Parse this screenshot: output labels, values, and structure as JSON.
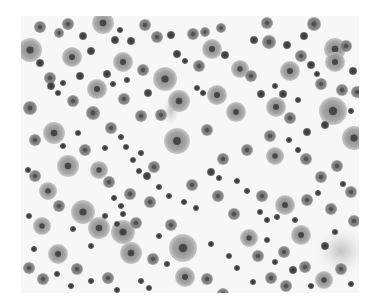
{
  "image": {
    "description": "Grayscale micrograph of many scattered round cells of varying size; large pale cells with dark central nuclei and numerous small dark cells on a light background",
    "width": 338,
    "height": 277,
    "background": "#f7f7f7",
    "colors": {
      "large_cell": "#9a9a9a",
      "large_cell_edge": "#b5b5b5",
      "nucleus": "#3a3a3a",
      "medium_cell": "#707070",
      "small_cell": "#4a4a4a",
      "smear": "#c8c8c8"
    },
    "smears": [
      {
        "cx": 320,
        "cy": 235,
        "rx": 30,
        "ry": 28
      },
      {
        "cx": 150,
        "cy": 95,
        "rx": 10,
        "ry": 18
      },
      {
        "cx": 330,
        "cy": 120,
        "rx": 12,
        "ry": 8
      }
    ],
    "large_cells": [
      {
        "cx": 9,
        "cy": 34,
        "r": 12
      },
      {
        "cx": 51,
        "cy": 41,
        "r": 10
      },
      {
        "cx": 82,
        "cy": 7,
        "r": 11
      },
      {
        "cx": 33,
        "cy": 117,
        "r": 11
      },
      {
        "cx": 47,
        "cy": 150,
        "r": 11
      },
      {
        "cx": 76,
        "cy": 73,
        "r": 10
      },
      {
        "cx": 102,
        "cy": 46,
        "r": 10
      },
      {
        "cx": 144,
        "cy": 63,
        "r": 12
      },
      {
        "cx": 156,
        "cy": 125,
        "r": 13
      },
      {
        "cx": 158,
        "cy": 85,
        "r": 11
      },
      {
        "cx": 191,
        "cy": 33,
        "r": 10
      },
      {
        "cx": 196,
        "cy": 79,
        "r": 10
      },
      {
        "cx": 215,
        "cy": 96,
        "r": 10
      },
      {
        "cx": 219,
        "cy": 53,
        "r": 9
      },
      {
        "cx": 255,
        "cy": 91,
        "r": 10
      },
      {
        "cx": 269,
        "cy": 55,
        "r": 10
      },
      {
        "cx": 312,
        "cy": 95,
        "r": 14
      },
      {
        "cx": 333,
        "cy": 122,
        "r": 12
      },
      {
        "cx": 314,
        "cy": 33,
        "r": 11
      },
      {
        "cx": 314,
        "cy": 46,
        "r": 10
      },
      {
        "cx": 303,
        "cy": 264,
        "r": 9
      },
      {
        "cx": 62,
        "cy": 196,
        "r": 12
      },
      {
        "cx": 78,
        "cy": 212,
        "r": 11
      },
      {
        "cx": 102,
        "cy": 216,
        "r": 12
      },
      {
        "cx": 110,
        "cy": 237,
        "r": 11
      },
      {
        "cx": 162,
        "cy": 232,
        "r": 14
      },
      {
        "cx": 164,
        "cy": 261,
        "r": 10
      },
      {
        "cx": 21,
        "cy": 210,
        "r": 9
      },
      {
        "cx": 37,
        "cy": 238,
        "r": 10
      },
      {
        "cx": 78,
        "cy": 154,
        "r": 9
      },
      {
        "cx": 264,
        "cy": 189,
        "r": 10
      },
      {
        "cx": 280,
        "cy": 219,
        "r": 10
      },
      {
        "cx": 254,
        "cy": 140,
        "r": 9
      },
      {
        "cx": 27,
        "cy": 175,
        "r": 9
      },
      {
        "cx": 228,
        "cy": 222,
        "r": 9
      }
    ],
    "medium_cells": [
      {
        "cx": 19,
        "cy": 11,
        "r": 6
      },
      {
        "cx": 47,
        "cy": 8,
        "r": 6
      },
      {
        "cx": 124,
        "cy": 9,
        "r": 6
      },
      {
        "cx": 172,
        "cy": 18,
        "r": 6
      },
      {
        "cx": 200,
        "cy": 12,
        "r": 5
      },
      {
        "cx": 248,
        "cy": 26,
        "r": 7
      },
      {
        "cx": 246,
        "cy": 7,
        "r": 6
      },
      {
        "cx": 293,
        "cy": 8,
        "r": 7
      },
      {
        "cx": 325,
        "cy": 30,
        "r": 6
      },
      {
        "cx": 29,
        "cy": 62,
        "r": 6
      },
      {
        "cx": 38,
        "cy": 17,
        "r": 5
      },
      {
        "cx": 72,
        "cy": 97,
        "r": 7
      },
      {
        "cx": 52,
        "cy": 85,
        "r": 6
      },
      {
        "cx": 103,
        "cy": 83,
        "r": 6
      },
      {
        "cx": 122,
        "cy": 54,
        "r": 6
      },
      {
        "cx": 136,
        "cy": 21,
        "r": 6
      },
      {
        "cx": 178,
        "cy": 50,
        "r": 6
      },
      {
        "cx": 184,
        "cy": 16,
        "r": 5
      },
      {
        "cx": 230,
        "cy": 60,
        "r": 6
      },
      {
        "cx": 280,
        "cy": 40,
        "r": 6
      },
      {
        "cx": 300,
        "cy": 68,
        "r": 6
      },
      {
        "cx": 321,
        "cy": 74,
        "r": 6
      },
      {
        "cx": 336,
        "cy": 76,
        "r": 6
      },
      {
        "cx": 9,
        "cy": 92,
        "r": 7
      },
      {
        "cx": 14,
        "cy": 124,
        "r": 6
      },
      {
        "cx": 64,
        "cy": 134,
        "r": 6
      },
      {
        "cx": 90,
        "cy": 112,
        "r": 6
      },
      {
        "cx": 120,
        "cy": 100,
        "r": 6
      },
      {
        "cx": 140,
        "cy": 99,
        "r": 6
      },
      {
        "cx": 186,
        "cy": 114,
        "r": 6
      },
      {
        "cx": 202,
        "cy": 143,
        "r": 6
      },
      {
        "cx": 226,
        "cy": 134,
        "r": 6
      },
      {
        "cx": 249,
        "cy": 120,
        "r": 6
      },
      {
        "cx": 269,
        "cy": 102,
        "r": 6
      },
      {
        "cx": 285,
        "cy": 143,
        "r": 6
      },
      {
        "cx": 300,
        "cy": 161,
        "r": 6
      },
      {
        "cx": 316,
        "cy": 150,
        "r": 6
      },
      {
        "cx": 330,
        "cy": 176,
        "r": 6
      },
      {
        "cx": 14,
        "cy": 160,
        "r": 6
      },
      {
        "cx": 38,
        "cy": 190,
        "r": 6
      },
      {
        "cx": 88,
        "cy": 166,
        "r": 6
      },
      {
        "cx": 109,
        "cy": 178,
        "r": 6
      },
      {
        "cx": 133,
        "cy": 151,
        "r": 6
      },
      {
        "cx": 171,
        "cy": 169,
        "r": 6
      },
      {
        "cx": 197,
        "cy": 180,
        "r": 6
      },
      {
        "cx": 213,
        "cy": 198,
        "r": 6
      },
      {
        "cx": 241,
        "cy": 180,
        "r": 6
      },
      {
        "cx": 286,
        "cy": 184,
        "r": 6
      },
      {
        "cx": 310,
        "cy": 193,
        "r": 6
      },
      {
        "cx": 8,
        "cy": 252,
        "r": 6
      },
      {
        "cx": 22,
        "cy": 263,
        "r": 6
      },
      {
        "cx": 56,
        "cy": 253,
        "r": 6
      },
      {
        "cx": 87,
        "cy": 262,
        "r": 6
      },
      {
        "cx": 132,
        "cy": 243,
        "r": 6
      },
      {
        "cx": 186,
        "cy": 263,
        "r": 6
      },
      {
        "cx": 202,
        "cy": 278,
        "r": 6
      },
      {
        "cx": 237,
        "cy": 240,
        "r": 6
      },
      {
        "cx": 263,
        "cy": 236,
        "r": 6
      },
      {
        "cx": 284,
        "cy": 251,
        "r": 6
      },
      {
        "cx": 250,
        "cy": 262,
        "r": 6
      },
      {
        "cx": 265,
        "cy": 270,
        "r": 6
      },
      {
        "cx": 320,
        "cy": 253,
        "r": 6
      },
      {
        "cx": 333,
        "cy": 205,
        "r": 6
      },
      {
        "cx": 150,
        "cy": 209,
        "r": 6
      },
      {
        "cx": 129,
        "cy": 186,
        "r": 6
      },
      {
        "cx": 115,
        "cy": 207,
        "r": 6
      }
    ],
    "small_cells": [
      {
        "cx": 62,
        "cy": 20,
        "r": 4
      },
      {
        "cx": 70,
        "cy": 35,
        "r": 4
      },
      {
        "cx": 94,
        "cy": 24,
        "r": 4
      },
      {
        "cx": 99,
        "cy": 14,
        "r": 3
      },
      {
        "cx": 110,
        "cy": 25,
        "r": 4
      },
      {
        "cx": 150,
        "cy": 19,
        "r": 4
      },
      {
        "cx": 156,
        "cy": 38,
        "r": 4
      },
      {
        "cx": 164,
        "cy": 45,
        "r": 3
      },
      {
        "cx": 204,
        "cy": 39,
        "r": 4
      },
      {
        "cx": 233,
        "cy": 24,
        "r": 4
      },
      {
        "cx": 266,
        "cy": 29,
        "r": 4
      },
      {
        "cx": 283,
        "cy": 20,
        "r": 4
      },
      {
        "cx": 290,
        "cy": 49,
        "r": 4
      },
      {
        "cx": 296,
        "cy": 58,
        "r": 3
      },
      {
        "cx": 332,
        "cy": 55,
        "r": 4
      },
      {
        "cx": 19,
        "cy": 47,
        "r": 4
      },
      {
        "cx": 30,
        "cy": 70,
        "r": 4
      },
      {
        "cx": 37,
        "cy": 77,
        "r": 3
      },
      {
        "cx": 42,
        "cy": 67,
        "r": 3
      },
      {
        "cx": 59,
        "cy": 60,
        "r": 4
      },
      {
        "cx": 86,
        "cy": 58,
        "r": 4
      },
      {
        "cx": 92,
        "cy": 68,
        "r": 3
      },
      {
        "cx": 106,
        "cy": 64,
        "r": 3
      },
      {
        "cx": 127,
        "cy": 77,
        "r": 4
      },
      {
        "cx": 176,
        "cy": 72,
        "r": 3
      },
      {
        "cx": 182,
        "cy": 77,
        "r": 3
      },
      {
        "cx": 240,
        "cy": 78,
        "r": 4
      },
      {
        "cx": 254,
        "cy": 70,
        "r": 3
      },
      {
        "cx": 262,
        "cy": 78,
        "r": 4
      },
      {
        "cx": 277,
        "cy": 84,
        "r": 3
      },
      {
        "cx": 330,
        "cy": 95,
        "r": 3
      },
      {
        "cx": 304,
        "cy": 109,
        "r": 4
      },
      {
        "cx": 286,
        "cy": 116,
        "r": 4
      },
      {
        "cx": 268,
        "cy": 124,
        "r": 3
      },
      {
        "cx": 277,
        "cy": 134,
        "r": 3
      },
      {
        "cx": 7,
        "cy": 154,
        "r": 3
      },
      {
        "cx": 42,
        "cy": 130,
        "r": 3
      },
      {
        "cx": 57,
        "cy": 117,
        "r": 3
      },
      {
        "cx": 84,
        "cy": 132,
        "r": 3
      },
      {
        "cx": 100,
        "cy": 121,
        "r": 3
      },
      {
        "cx": 105,
        "cy": 131,
        "r": 3
      },
      {
        "cx": 112,
        "cy": 144,
        "r": 3
      },
      {
        "cx": 120,
        "cy": 137,
        "r": 3
      },
      {
        "cx": 118,
        "cy": 155,
        "r": 3
      },
      {
        "cx": 126,
        "cy": 160,
        "r": 4
      },
      {
        "cx": 93,
        "cy": 182,
        "r": 3
      },
      {
        "cx": 100,
        "cy": 190,
        "r": 3
      },
      {
        "cx": 138,
        "cy": 171,
        "r": 3
      },
      {
        "cx": 148,
        "cy": 180,
        "r": 3
      },
      {
        "cx": 163,
        "cy": 186,
        "r": 3
      },
      {
        "cx": 175,
        "cy": 192,
        "r": 3
      },
      {
        "cx": 190,
        "cy": 156,
        "r": 4
      },
      {
        "cx": 198,
        "cy": 162,
        "r": 3
      },
      {
        "cx": 216,
        "cy": 165,
        "r": 3
      },
      {
        "cx": 226,
        "cy": 175,
        "r": 3
      },
      {
        "cx": 239,
        "cy": 196,
        "r": 3
      },
      {
        "cx": 246,
        "cy": 204,
        "r": 3
      },
      {
        "cx": 256,
        "cy": 201,
        "r": 3
      },
      {
        "cx": 274,
        "cy": 204,
        "r": 3
      },
      {
        "cx": 297,
        "cy": 177,
        "r": 3
      },
      {
        "cx": 322,
        "cy": 168,
        "r": 3
      },
      {
        "cx": 8,
        "cy": 200,
        "r": 3
      },
      {
        "cx": 52,
        "cy": 213,
        "r": 3
      },
      {
        "cx": 70,
        "cy": 230,
        "r": 3
      },
      {
        "cx": 84,
        "cy": 200,
        "r": 3
      },
      {
        "cx": 96,
        "cy": 208,
        "r": 3
      },
      {
        "cx": 102,
        "cy": 198,
        "r": 3
      },
      {
        "cx": 138,
        "cy": 220,
        "r": 3
      },
      {
        "cx": 146,
        "cy": 248,
        "r": 3
      },
      {
        "cx": 120,
        "cy": 265,
        "r": 3
      },
      {
        "cx": 128,
        "cy": 272,
        "r": 3
      },
      {
        "cx": 190,
        "cy": 228,
        "r": 3
      },
      {
        "cx": 208,
        "cy": 240,
        "r": 3
      },
      {
        "cx": 216,
        "cy": 252,
        "r": 3
      },
      {
        "cx": 232,
        "cy": 266,
        "r": 3
      },
      {
        "cx": 272,
        "cy": 254,
        "r": 4
      },
      {
        "cx": 290,
        "cy": 270,
        "r": 3
      },
      {
        "cx": 304,
        "cy": 230,
        "r": 4
      },
      {
        "cx": 314,
        "cy": 216,
        "r": 3
      },
      {
        "cx": 330,
        "cy": 268,
        "r": 3
      },
      {
        "cx": 50,
        "cy": 270,
        "r": 3
      },
      {
        "cx": 70,
        "cy": 265,
        "r": 3
      },
      {
        "cx": 96,
        "cy": 274,
        "r": 3
      },
      {
        "cx": 246,
        "cy": 224,
        "r": 3
      },
      {
        "cx": 254,
        "cy": 246,
        "r": 3
      },
      {
        "cx": 36,
        "cy": 258,
        "r": 3
      },
      {
        "cx": 13,
        "cy": 233,
        "r": 3
      }
    ]
  }
}
